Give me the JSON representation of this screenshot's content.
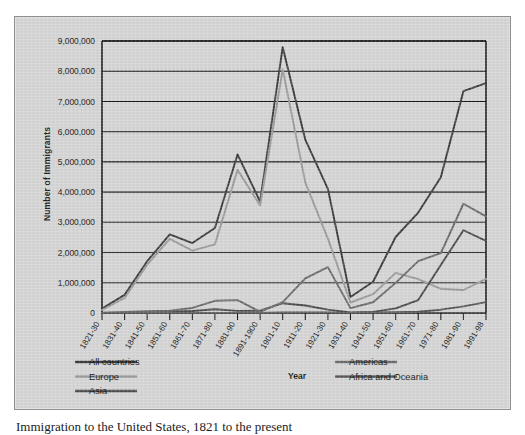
{
  "figure": {
    "caption": "Immigration to the United States, 1821 to the present"
  },
  "chart_data": {
    "type": "line",
    "title": "",
    "xlabel": "Year",
    "ylabel": "Number of Immigrants",
    "ylim": [
      0,
      9000000
    ],
    "grid": true,
    "legend_position": "bottom",
    "categories": [
      "1821-30",
      "1831-40",
      "1841-50",
      "1851-60",
      "1861-70",
      "1871-80",
      "1881-90",
      "1891-1900",
      "1901-10",
      "1911-20",
      "1921-30",
      "1931-40",
      "1941-50",
      "1951-60",
      "1961-70",
      "1971-80",
      "1981-90",
      "1991-98"
    ],
    "ytick_labels": [
      "0",
      "1,000,000",
      "2,000,000",
      "3,000,000",
      "4,000,000",
      "5,000,000",
      "6,000,000",
      "7,000,000",
      "8,000,000",
      "9,000,000"
    ],
    "ytick_values": [
      0,
      1000000,
      2000000,
      3000000,
      4000000,
      5000000,
      6000000,
      7000000,
      8000000,
      9000000
    ],
    "series": [
      {
        "name": "All countries",
        "color": "#3a3a3a",
        "width": 1.9,
        "values": [
          143439,
          599125,
          1713251,
          2598214,
          2314824,
          2812191,
          5246613,
          3687564,
          8795386,
          5735811,
          4107209,
          528431,
          1035039,
          2515479,
          3321677,
          4493314,
          7338062,
          7605068
        ]
      },
      {
        "name": "Europe",
        "color": "#9a9a9a",
        "width": 1.9,
        "values": [
          98797,
          495681,
          1597442,
          2452577,
          2065141,
          2271925,
          4735484,
          3555352,
          8056040,
          4321887,
          2463194,
          347566,
          621147,
          1325727,
          1123492,
          800368,
          761550,
          1132221
        ]
      },
      {
        "name": "Asia",
        "color": "#4a4a4a",
        "width": 1.9,
        "values": [
          36,
          55,
          141,
          41538,
          64759,
          124160,
          69942,
          74862,
          323543,
          247236,
          112059,
          16595,
          37028,
          153249,
          427642,
          1588178,
          2738157,
          2385000
        ]
      },
      {
        "name": "Americas",
        "color": "#6a6a6a",
        "width": 1.9,
        "values": [
          11564,
          33424,
          62469,
          74720,
          166607,
          404044,
          426967,
          38972,
          361888,
          1143671,
          1516716,
          160037,
          354804,
          996944,
          1716374,
          1982735,
          3615225,
          3197000
        ]
      },
      {
        "name": "Africa and Oceania",
        "color": "#555555",
        "width": 1.9,
        "values": [
          33,
          69,
          59,
          262,
          619,
          1228,
          3222,
          1445,
          14175,
          21820,
          14597,
          3392,
          14379,
          27200,
          42000,
          110000,
          218000,
          360000
        ]
      }
    ],
    "legend_columns": [
      [
        "All countries",
        "Europe",
        "Asia"
      ],
      [
        "Americas",
        "Africa and Oceania"
      ]
    ]
  }
}
